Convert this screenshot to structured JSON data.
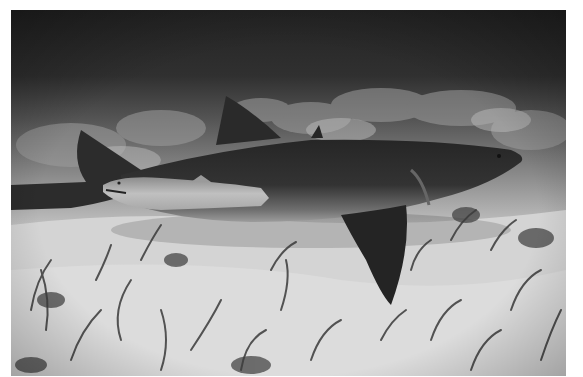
{
  "photo": {
    "subject": "shark-with-remora",
    "palette": {
      "water_top": "#262626",
      "water_mid": "#4a4a4a",
      "sand": "#d8d8d8",
      "shark_body": "#2e2e2e",
      "shark_belly": "#9a9a9a",
      "remora": "#b4b4b4",
      "seagrass": "#3a3a3a"
    }
  }
}
